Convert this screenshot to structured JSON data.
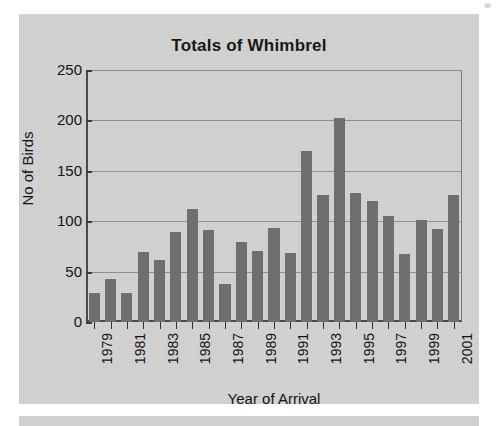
{
  "chart_data": {
    "type": "bar",
    "title": "Totals of Whimbrel",
    "xlabel": "Year of Arrival",
    "ylabel": "No of Birds",
    "ylim": [
      0,
      250
    ],
    "ytick_labels": [
      "250",
      "200",
      "150",
      "100",
      "50",
      "0"
    ],
    "ytick_values": [
      250,
      200,
      150,
      100,
      50,
      0
    ],
    "grid": true,
    "legend": "none",
    "bar_color": "#6f6f6f",
    "plot_background": "#d4d4d4",
    "categories": [
      "1979",
      "1980",
      "1981",
      "1982",
      "1983",
      "1984",
      "1985",
      "1986",
      "1987",
      "1988",
      "1989",
      "1990",
      "1991",
      "1992",
      "1993",
      "1994",
      "1995",
      "1996",
      "1997",
      "1998",
      "1999",
      "2000",
      "2001"
    ],
    "labeled_categories": [
      "1979",
      "1981",
      "1983",
      "1985",
      "1987",
      "1989",
      "1991",
      "1993",
      "1995",
      "1997",
      "1999",
      "2001"
    ],
    "values": [
      29,
      43,
      29,
      69,
      62,
      89,
      112,
      91,
      38,
      79,
      70,
      93,
      68,
      170,
      126,
      202,
      128,
      120,
      105,
      67,
      101,
      92,
      126
    ]
  },
  "panel": {
    "title": "Totals of Whimbrel"
  }
}
